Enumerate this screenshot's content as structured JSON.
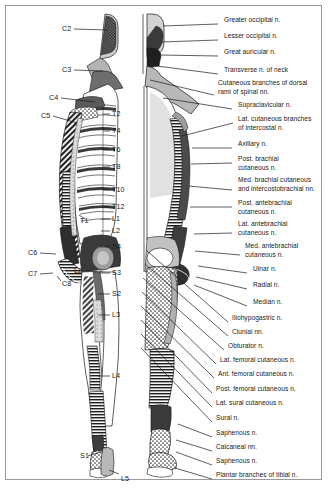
{
  "figure": {
    "border_color": "#9a9a9a",
    "background": "#ffffff",
    "ink_color": "#1a1a1a",
    "tone_light": "#d6d6d6",
    "tone_mid": "#a8a8a8",
    "tone_dark": "#4a4a4a",
    "tone_black": "#222222"
  },
  "left_figure": {
    "name": "dermatome-figure",
    "description": "Posterior view body figure with segmental dermatome level markers",
    "levels": [
      {
        "label": "C2",
        "x": 62,
        "y": 28,
        "lead_to_x": 110,
        "lead_to_y": 30,
        "side": "left"
      },
      {
        "label": "C3",
        "x": 62,
        "y": 69,
        "lead_to_x": 104,
        "lead_to_y": 70,
        "side": "left"
      },
      {
        "label": "C4",
        "x": 49,
        "y": 97,
        "lead_to_x": 96,
        "lead_to_y": 101,
        "side": "left"
      },
      {
        "label": "C5",
        "x": 41,
        "y": 115,
        "lead_to_x": 78,
        "lead_to_y": 122,
        "side": "left"
      },
      {
        "label": "C6",
        "x": 28,
        "y": 252,
        "lead_to_x": 56,
        "lead_to_y": 254,
        "side": "left"
      },
      {
        "label": "C7",
        "x": 28,
        "y": 273,
        "lead_to_x": 53,
        "lead_to_y": 272,
        "side": "left"
      },
      {
        "label": "C8",
        "x": 62,
        "y": 283,
        "lead_to_x": 57,
        "lead_to_y": 277,
        "side": "left"
      },
      {
        "label": "T1",
        "x": 80,
        "y": 220,
        "lead_to_x": 78,
        "lead_to_y": 216,
        "side": "left"
      },
      {
        "label": "L2",
        "x": 74,
        "y": 270,
        "lead_to_x": 95,
        "lead_to_y": 270,
        "side": "left"
      },
      {
        "label": "T2",
        "x": 112,
        "y": 113,
        "lead_to_x": 104,
        "lead_to_y": 114,
        "side": "right"
      },
      {
        "label": "T4",
        "x": 112,
        "y": 130,
        "lead_to_x": 104,
        "lead_to_y": 131,
        "side": "right"
      },
      {
        "label": "T6",
        "x": 112,
        "y": 149,
        "lead_to_x": 104,
        "lead_to_y": 150,
        "side": "right"
      },
      {
        "label": "T8",
        "x": 112,
        "y": 166,
        "lead_to_x": 104,
        "lead_to_y": 167,
        "side": "right"
      },
      {
        "label": "T10",
        "x": 112,
        "y": 189,
        "lead_to_x": 104,
        "lead_to_y": 190,
        "side": "right"
      },
      {
        "label": "T12",
        "x": 112,
        "y": 206,
        "lead_to_x": 104,
        "lead_to_y": 207,
        "side": "right"
      },
      {
        "label": "L1",
        "x": 112,
        "y": 218,
        "lead_to_x": 104,
        "lead_to_y": 219,
        "side": "right"
      },
      {
        "label": "L2",
        "x": 112,
        "y": 230,
        "lead_to_x": 104,
        "lead_to_y": 231,
        "side": "right"
      },
      {
        "label": "S4",
        "x": 112,
        "y": 246,
        "lead_to_x": 101,
        "lead_to_y": 247,
        "side": "right"
      },
      {
        "label": "S3",
        "x": 112,
        "y": 272,
        "lead_to_x": 101,
        "lead_to_y": 273,
        "side": "right"
      },
      {
        "label": "S2",
        "x": 112,
        "y": 293,
        "lead_to_x": 99,
        "lead_to_y": 294,
        "side": "right"
      },
      {
        "label": "L3",
        "x": 112,
        "y": 314,
        "lead_to_x": 99,
        "lead_to_y": 315,
        "side": "right"
      },
      {
        "label": "L4",
        "x": 112,
        "y": 375,
        "lead_to_x": 99,
        "lead_to_y": 376,
        "side": "right"
      },
      {
        "label": "S1",
        "x": 80,
        "y": 455,
        "lead_to_x": 101,
        "lead_to_y": 452,
        "side": "left"
      },
      {
        "label": "L5",
        "x": 121,
        "y": 478,
        "lead_to_x": 108,
        "lead_to_y": 473,
        "side": "right"
      }
    ]
  },
  "right_figure": {
    "name": "peripheral-nerve-figure",
    "description": "Body figure with named peripheral cutaneous nerve leader lines",
    "nerve_labels": [
      {
        "lines": [
          "Greater occipital n."
        ],
        "x": 224,
        "y": 21,
        "lead_x": 218,
        "lead_y": 24,
        "anchor_x": 163,
        "anchor_y": 26
      },
      {
        "lines": [
          "Lesser occipital n."
        ],
        "x": 224,
        "y": 37,
        "lead_x": 218,
        "lead_y": 40,
        "anchor_x": 160,
        "anchor_y": 42
      },
      {
        "lines": [
          "Great auricular n."
        ],
        "x": 224,
        "y": 53,
        "lead_x": 218,
        "lead_y": 56,
        "anchor_x": 159,
        "anchor_y": 56
      },
      {
        "lines": [
          "Transverse n. of neck"
        ],
        "x": 224,
        "y": 71,
        "lead_x": 218,
        "lead_y": 74,
        "anchor_x": 157,
        "anchor_y": 66
      },
      {
        "lines": [
          "Cutaneous branches of dorsal",
          "rami of spinal nn."
        ],
        "x": 218,
        "y": 84,
        "lead_x": 214,
        "lead_y": 87,
        "anchor_x": 150,
        "anchor_y": 80
      },
      {
        "lines": [
          "Supraclavicular n."
        ],
        "x": 238,
        "y": 106,
        "lead_x": 232,
        "lead_y": 109,
        "anchor_x": 160,
        "anchor_y": 99
      },
      {
        "lines": [
          "Lat. cutaneous branches",
          "of intercostal n."
        ],
        "x": 238,
        "y": 120,
        "lead_x": 233,
        "lead_y": 123,
        "anchor_x": 181,
        "anchor_y": 135
      },
      {
        "lines": [
          "Axillary n."
        ],
        "x": 238,
        "y": 145,
        "lead_x": 232,
        "lead_y": 148,
        "anchor_x": 191,
        "anchor_y": 148
      },
      {
        "lines": [
          "Post. brachial",
          "cutaneous n."
        ],
        "x": 238,
        "y": 160,
        "lead_x": 232,
        "lead_y": 163,
        "anchor_x": 190,
        "anchor_y": 163
      },
      {
        "lines": [
          "Med. brachial cutaneous",
          "and intercostobrachial nn."
        ],
        "x": 238,
        "y": 181,
        "lead_x": 232,
        "lead_y": 184,
        "anchor_x": 188,
        "anchor_y": 185
      },
      {
        "lines": [
          "Post. antebrachial",
          "cutaneous n."
        ],
        "x": 238,
        "y": 204,
        "lead_x": 232,
        "lead_y": 207,
        "anchor_x": 190,
        "anchor_y": 206
      },
      {
        "lines": [
          "Lat. antebrachial",
          "cutaneous n."
        ],
        "x": 238,
        "y": 225,
        "lead_x": 232,
        "lead_y": 228,
        "anchor_x": 193,
        "anchor_y": 233
      },
      {
        "lines": [
          "Med. antebrachial",
          "cutaneous n."
        ],
        "x": 245,
        "y": 247,
        "lead_x": 240,
        "lead_y": 250,
        "anchor_x": 193,
        "anchor_y": 250
      },
      {
        "lines": [
          "Ulnar n."
        ],
        "x": 253,
        "y": 270,
        "lead_x": 247,
        "lead_y": 273,
        "anchor_x": 197,
        "anchor_y": 266
      },
      {
        "lines": [
          "Radial n."
        ],
        "x": 253,
        "y": 286,
        "lead_x": 247,
        "lead_y": 289,
        "anchor_x": 196,
        "anchor_y": 277
      },
      {
        "lines": [
          "Median n."
        ],
        "x": 253,
        "y": 303,
        "lead_x": 247,
        "lead_y": 306,
        "anchor_x": 194,
        "anchor_y": 285
      },
      {
        "lines": [
          "Iliohypogastric n."
        ],
        "x": 232,
        "y": 319,
        "lead_x": 228,
        "lead_y": 322,
        "anchor_x": 145,
        "anchor_y": 248
      },
      {
        "lines": [
          "Clunial nn."
        ],
        "x": 232,
        "y": 333,
        "lead_x": 228,
        "lead_y": 336,
        "anchor_x": 143,
        "anchor_y": 262
      },
      {
        "lines": [
          "Obturator n."
        ],
        "x": 228,
        "y": 347,
        "lead_x": 224,
        "lead_y": 350,
        "anchor_x": 141,
        "anchor_y": 276
      },
      {
        "lines": [
          "Lat. femoral cutaneous n."
        ],
        "x": 220,
        "y": 361,
        "lead_x": 216,
        "lead_y": 364,
        "anchor_x": 140,
        "anchor_y": 289
      },
      {
        "lines": [
          "Ant. femoral cutaneous n."
        ],
        "x": 218,
        "y": 375,
        "lead_x": 214,
        "lead_y": 378,
        "anchor_x": 139,
        "anchor_y": 301
      },
      {
        "lines": [
          "Post. femoral cutaneous n."
        ],
        "x": 216,
        "y": 390,
        "lead_x": 212,
        "lead_y": 393,
        "anchor_x": 139,
        "anchor_y": 312
      },
      {
        "lines": [
          "Lat. sural cutaneous n."
        ],
        "x": 216,
        "y": 404,
        "lead_x": 212,
        "lead_y": 407,
        "anchor_x": 139,
        "anchor_y": 323
      },
      {
        "lines": [
          "Sural n."
        ],
        "x": 216,
        "y": 419,
        "lead_x": 212,
        "lead_y": 422,
        "anchor_x": 139,
        "anchor_y": 334
      },
      {
        "lines": [
          "Saphenous n."
        ],
        "x": 216,
        "y": 434,
        "lead_x": 212,
        "lead_y": 437,
        "anchor_x": 178,
        "anchor_y": 424
      },
      {
        "lines": [
          "Calcaneal nn."
        ],
        "x": 216,
        "y": 448,
        "lead_x": 212,
        "lead_y": 451,
        "anchor_x": 177,
        "anchor_y": 440
      },
      {
        "lines": [
          "Saphenous n."
        ],
        "x": 216,
        "y": 462,
        "lead_x": 212,
        "lead_y": 465,
        "anchor_x": 177,
        "anchor_y": 452
      },
      {
        "lines": [
          "Plantar branches of tibial n."
        ],
        "x": 216,
        "y": 476,
        "lead_x": 212,
        "lead_y": 479,
        "anchor_x": 176,
        "anchor_y": 468
      }
    ]
  }
}
